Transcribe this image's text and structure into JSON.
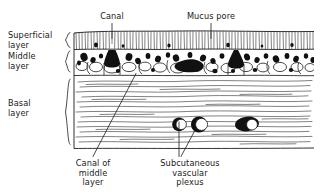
{
  "figure": {
    "kind": "histological-cross-section-diagram",
    "colors": {
      "ink": "#1a1a1a",
      "background": "#ffffff",
      "fill_dark": "#111111",
      "fill_light": "#ffffff"
    }
  },
  "labels": {
    "superficial_layer": "Superficial\nlayer",
    "middle_layer": "Middle\nlayer",
    "basal_layer": "Basal\nlayer",
    "canal": "Canal",
    "mucus_pore": "Mucus pore",
    "canal_of_middle_layer": "Canal of\nmiddle\nlayer",
    "subcutaneous_vascular_plexus": "Subcutaneous\nvascular\nplexus"
  },
  "structures": {
    "layers": [
      {
        "name": "Superficial layer",
        "top": 32,
        "bottom": 50
      },
      {
        "name": "Middle layer",
        "top": 50,
        "bottom": 76
      },
      {
        "name": "Basal layer",
        "top": 76,
        "bottom": 148
      }
    ],
    "vessels": [
      {
        "name": "vessel-left",
        "cx": 179,
        "cy": 124
      },
      {
        "name": "vessel-middle",
        "cx": 199,
        "cy": 124
      },
      {
        "name": "vessel-right",
        "cx": 247,
        "cy": 124
      }
    ],
    "leaders": [
      {
        "name": "canal-leader",
        "from": [
          112,
          24
        ],
        "to": [
          112,
          38
        ]
      },
      {
        "name": "mucus-pore-leader",
        "from": [
          211,
          24
        ],
        "to": [
          211,
          38
        ]
      },
      {
        "name": "canal-of-middle-layer-leader",
        "from": [
          136,
          74
        ],
        "to": [
          93,
          157
        ]
      },
      {
        "name": "plexus-leader-left",
        "from": [
          179,
          123
        ],
        "to": [
          179,
          157
        ]
      },
      {
        "name": "plexus-leader-right",
        "from": [
          197,
          127
        ],
        "to": [
          181,
          157
        ]
      }
    ]
  }
}
